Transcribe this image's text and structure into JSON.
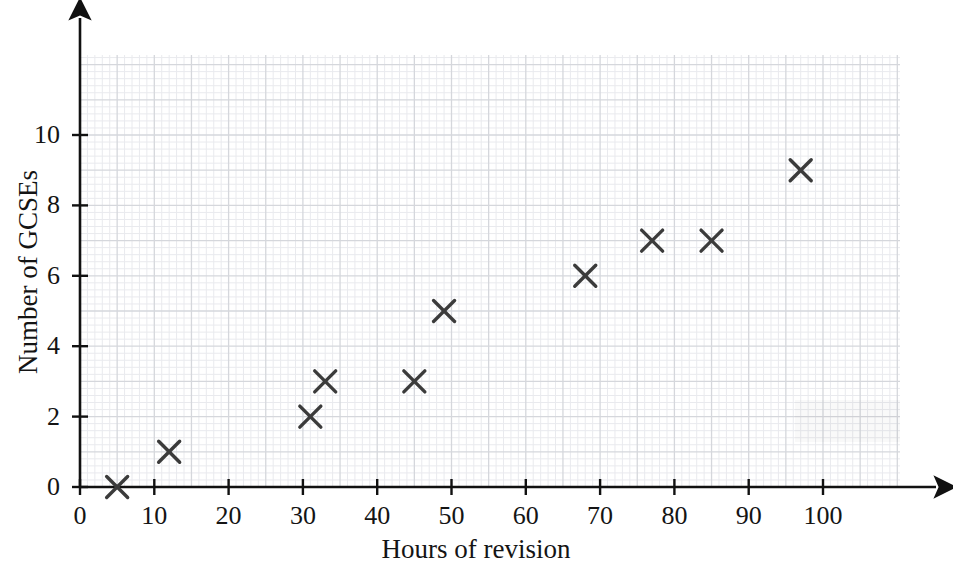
{
  "chart_data": {
    "type": "scatter",
    "title": "",
    "xlabel": "Hours of revision",
    "ylabel": "Number of GCSEs",
    "xlim": [
      0,
      110
    ],
    "ylim": [
      0,
      11.7
    ],
    "xticks": [
      0,
      10,
      20,
      30,
      40,
      50,
      60,
      70,
      80,
      90,
      100
    ],
    "yticks": [
      0,
      2,
      4,
      6,
      8,
      10
    ],
    "xtick_labels": [
      "0",
      "10",
      "20",
      "30",
      "40",
      "50",
      "60",
      "70",
      "80",
      "90",
      "100"
    ],
    "ytick_labels": [
      "0",
      "2",
      "4",
      "6",
      "8",
      "10"
    ],
    "grid": true,
    "grid_major_x_step": 5,
    "grid_major_y_step": 1,
    "grid_minor_x_step": 1,
    "grid_minor_y_step": 0.2,
    "legend": null,
    "marker": "x-cross",
    "marker_color": "#3b3b3b",
    "points": [
      {
        "x": 5,
        "y": 0
      },
      {
        "x": 12,
        "y": 1
      },
      {
        "x": 31,
        "y": 2
      },
      {
        "x": 33,
        "y": 3
      },
      {
        "x": 45,
        "y": 3
      },
      {
        "x": 49,
        "y": 5
      },
      {
        "x": 68,
        "y": 6
      },
      {
        "x": 77,
        "y": 7
      },
      {
        "x": 85,
        "y": 7
      },
      {
        "x": 97,
        "y": 9
      }
    ],
    "x": [
      5,
      12,
      31,
      33,
      45,
      49,
      68,
      77,
      85,
      97
    ],
    "y": [
      0,
      1,
      2,
      3,
      3,
      5,
      6,
      7,
      7,
      9
    ],
    "series": [
      {
        "name": "students",
        "x": [
          5,
          12,
          31,
          33,
          45,
          49,
          68,
          77,
          85,
          97
        ],
        "values": [
          0,
          1,
          2,
          3,
          3,
          5,
          6,
          7,
          7,
          9
        ]
      }
    ]
  },
  "colors": {
    "axis": "#111111",
    "marker": "#3b3b3b",
    "grid_major": "#d5d7dc",
    "grid_minor": "#e9eaee",
    "background": "#ffffff",
    "text": "#141414"
  }
}
